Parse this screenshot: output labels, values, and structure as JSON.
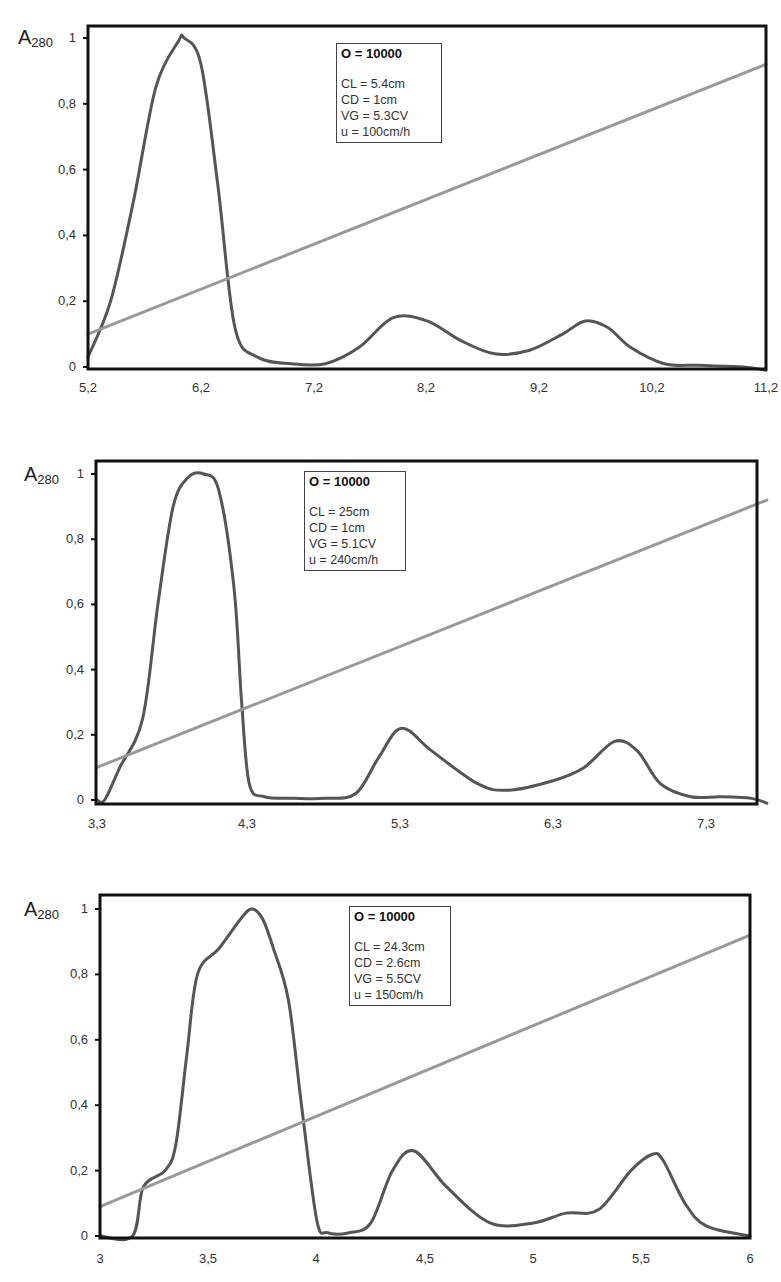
{
  "chart_data": [
    {
      "type": "line",
      "title": "",
      "ylabel": "A280",
      "xlabel": "",
      "xlim": [
        5.2,
        11.2
      ],
      "ylim": [
        0,
        1
      ],
      "x_ticks": [
        "5,2",
        "6,2",
        "7,2",
        "8,2",
        "9,2",
        "10,2",
        "11,2"
      ],
      "y_ticks": [
        "0",
        "0,2",
        "0,4",
        "0,6",
        "0,8",
        "1"
      ],
      "annotation": {
        "header": "O = 10000",
        "lines": [
          "CL = 5.4cm",
          "CD = 1cm",
          "VG = 5.3CV",
          "u = 100cm/h"
        ]
      },
      "series": [
        {
          "name": "A280 absorbance",
          "color": "#555555",
          "x": [
            5.2,
            5.4,
            5.6,
            5.8,
            6.0,
            6.05,
            6.2,
            6.35,
            6.5,
            6.7,
            7.0,
            7.3,
            7.6,
            7.9,
            8.2,
            8.5,
            8.8,
            9.1,
            9.4,
            9.6,
            9.8,
            10.0,
            10.3,
            10.6,
            11.0,
            11.2
          ],
          "y": [
            0.03,
            0.2,
            0.5,
            0.85,
            0.99,
            1.0,
            0.92,
            0.55,
            0.12,
            0.03,
            0.01,
            0.01,
            0.06,
            0.15,
            0.14,
            0.08,
            0.04,
            0.05,
            0.1,
            0.14,
            0.12,
            0.06,
            0.01,
            0.005,
            0.0,
            -0.01
          ]
        },
        {
          "name": "Gradient",
          "color": "#999999",
          "x": [
            5.2,
            11.2
          ],
          "y": [
            0.1,
            0.92
          ]
        }
      ]
    },
    {
      "type": "line",
      "title": "",
      "ylabel": "A280",
      "xlabel": "",
      "xlim": [
        3.3,
        7.7
      ],
      "ylim": [
        0,
        1
      ],
      "x_ticks": [
        "3,3",
        "4,3",
        "5,3",
        "6,3",
        "7,3"
      ],
      "y_ticks": [
        "0",
        "0,2",
        "0,4",
        "0,6",
        "0,8",
        "1"
      ],
      "annotation": {
        "header": "O = 10000",
        "lines": [
          "CL = 25cm",
          "CD = 1cm",
          "VG = 5.1CV",
          "u = 240cm/h"
        ]
      },
      "series": [
        {
          "name": "A280 absorbance",
          "color": "#555555",
          "x": [
            3.3,
            3.35,
            3.45,
            3.6,
            3.7,
            3.8,
            3.9,
            4.0,
            4.1,
            4.2,
            4.25,
            4.3,
            4.4,
            4.6,
            4.8,
            5.0,
            5.15,
            5.3,
            5.5,
            5.8,
            6.0,
            6.3,
            6.5,
            6.7,
            6.85,
            7.0,
            7.2,
            7.4,
            7.6,
            7.7
          ],
          "y": [
            0.0,
            0.0,
            0.1,
            0.25,
            0.6,
            0.9,
            0.99,
            1.0,
            0.95,
            0.65,
            0.3,
            0.05,
            0.01,
            0.005,
            0.005,
            0.02,
            0.13,
            0.22,
            0.15,
            0.05,
            0.03,
            0.06,
            0.1,
            0.18,
            0.15,
            0.05,
            0.01,
            0.01,
            0.005,
            -0.01
          ]
        },
        {
          "name": "Gradient",
          "color": "#999999",
          "x": [
            3.3,
            7.7
          ],
          "y": [
            0.1,
            0.92
          ]
        }
      ]
    },
    {
      "type": "line",
      "title": "",
      "ylabel": "A280",
      "xlabel": "",
      "xlim": [
        3.0,
        6.0
      ],
      "ylim": [
        0,
        1
      ],
      "x_ticks": [
        "3",
        "3,5",
        "4",
        "4,5",
        "5",
        "5,5",
        "6"
      ],
      "y_ticks": [
        "0",
        "0,2",
        "0,4",
        "0,6",
        "0,8",
        "1"
      ],
      "annotation": {
        "header": "O = 10000",
        "lines": [
          "CL = 24.3cm",
          "CD = 2.6cm",
          "VG = 5.5CV",
          "u = 150cm/h"
        ]
      },
      "series": [
        {
          "name": "A280 absorbance",
          "color": "#555555",
          "x": [
            3.0,
            3.15,
            3.2,
            3.3,
            3.35,
            3.4,
            3.45,
            3.55,
            3.65,
            3.7,
            3.75,
            3.8,
            3.87,
            3.93,
            4.0,
            4.05,
            4.15,
            4.25,
            4.35,
            4.45,
            4.6,
            4.8,
            5.0,
            5.15,
            5.3,
            5.45,
            5.55,
            5.6,
            5.7,
            5.8,
            6.0
          ],
          "y": [
            0.0,
            0.0,
            0.15,
            0.2,
            0.28,
            0.55,
            0.8,
            0.88,
            0.97,
            1.0,
            0.97,
            0.88,
            0.72,
            0.4,
            0.05,
            0.01,
            0.01,
            0.04,
            0.2,
            0.26,
            0.15,
            0.04,
            0.04,
            0.07,
            0.08,
            0.2,
            0.25,
            0.23,
            0.1,
            0.03,
            0.0
          ]
        },
        {
          "name": "Gradient",
          "color": "#999999",
          "x": [
            3.0,
            6.0
          ],
          "y": [
            0.09,
            0.92
          ]
        }
      ]
    }
  ]
}
